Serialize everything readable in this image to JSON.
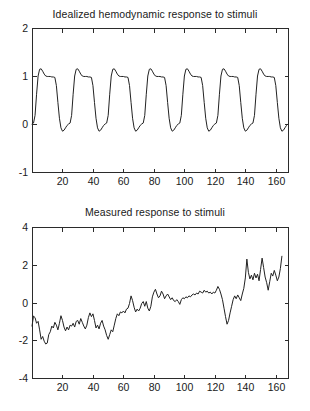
{
  "figure": {
    "background_color": "#ffffff",
    "line_color": "#222222",
    "axis_color": "#2b2b2b"
  },
  "charts": {
    "top": {
      "title": "Idealized hemodynamic response to stimuli",
      "ytick_labels": [
        "2",
        "1",
        "0",
        "-1"
      ],
      "xtick_labels": [
        "20",
        "40",
        "60",
        "80",
        "100",
        "120",
        "140",
        "160"
      ]
    },
    "bottom": {
      "title": "Measured response to stimuli",
      "ytick_labels": [
        "4",
        "2",
        "0",
        "-2",
        "-4"
      ],
      "xtick_labels": [
        "20",
        "40",
        "60",
        "80",
        "100",
        "120",
        "140",
        "160"
      ]
    }
  },
  "chart_data": [
    {
      "type": "line",
      "id": "idealized-hemodynamic-response",
      "title": "Idealized hemodynamic response to stimuli",
      "xlabel": "",
      "ylabel": "",
      "xlim": [
        0,
        168
      ],
      "ylim": [
        -1,
        2
      ],
      "xticks": [
        20,
        40,
        60,
        80,
        100,
        120,
        140,
        160
      ],
      "yticks": [
        -1,
        0,
        1,
        2
      ],
      "grid": false,
      "legend": null,
      "series": [
        {
          "name": "idealized response",
          "color": "#222222",
          "x": [
            0,
            1,
            2,
            3,
            4,
            5,
            6,
            7,
            8,
            9,
            10,
            11,
            12,
            13,
            14,
            15,
            16,
            17,
            18,
            19,
            20,
            21,
            22,
            23,
            24,
            25,
            26,
            27,
            28,
            29,
            30,
            31,
            32,
            33,
            34,
            35,
            36,
            37,
            38,
            39,
            40,
            41,
            42,
            43,
            44,
            45,
            46,
            47,
            48,
            49,
            50,
            51,
            52,
            53,
            54,
            55,
            56,
            57,
            58,
            59,
            60,
            61,
            62,
            63,
            64,
            65,
            66,
            67,
            68,
            69,
            70,
            71,
            72,
            73,
            74,
            75,
            76,
            77,
            78,
            79,
            80,
            81,
            82,
            83,
            84,
            85,
            86,
            87,
            88,
            89,
            90,
            91,
            92,
            93,
            94,
            95,
            96,
            97,
            98,
            99,
            100,
            101,
            102,
            103,
            104,
            105,
            106,
            107,
            108,
            109,
            110,
            111,
            112,
            113,
            114,
            115,
            116,
            117,
            118,
            119,
            120,
            121,
            122,
            123,
            124,
            125,
            126,
            127,
            128,
            129,
            130,
            131,
            132,
            133,
            134,
            135,
            136,
            137,
            138,
            139,
            140,
            141,
            142,
            143,
            144,
            145,
            146,
            147,
            148,
            149,
            150,
            151,
            152,
            153,
            154,
            155,
            156,
            157,
            158,
            159,
            160,
            161,
            162,
            163,
            164,
            165,
            166,
            167,
            168
          ],
          "y": [
            0.0,
            0.02,
            0.18,
            0.62,
            1.0,
            1.14,
            1.15,
            1.1,
            1.04,
            1.0,
            0.99,
            0.99,
            0.99,
            0.98,
            0.98,
            0.97,
            0.8,
            0.45,
            0.12,
            -0.08,
            -0.15,
            -0.13,
            -0.08,
            -0.03,
            0.0,
            0.02,
            0.18,
            0.62,
            1.0,
            1.14,
            1.15,
            1.1,
            1.04,
            1.0,
            0.99,
            0.99,
            0.99,
            0.98,
            0.98,
            0.97,
            0.8,
            0.45,
            0.12,
            -0.08,
            -0.15,
            -0.13,
            -0.08,
            -0.03,
            0.0,
            0.02,
            0.18,
            0.62,
            1.0,
            1.14,
            1.15,
            1.1,
            1.04,
            1.0,
            0.99,
            0.99,
            0.99,
            0.98,
            0.98,
            0.97,
            0.8,
            0.45,
            0.12,
            -0.08,
            -0.15,
            -0.13,
            -0.08,
            -0.03,
            0.0,
            0.02,
            0.18,
            0.62,
            1.0,
            1.14,
            1.15,
            1.1,
            1.04,
            1.0,
            0.99,
            0.99,
            0.99,
            0.98,
            0.98,
            0.97,
            0.8,
            0.45,
            0.12,
            -0.08,
            -0.15,
            -0.13,
            -0.08,
            -0.03,
            0.0,
            0.02,
            0.18,
            0.62,
            1.0,
            1.14,
            1.15,
            1.1,
            1.04,
            1.0,
            0.99,
            0.99,
            0.99,
            0.98,
            0.98,
            0.97,
            0.8,
            0.45,
            0.12,
            -0.08,
            -0.15,
            -0.13,
            -0.08,
            -0.03,
            0.0,
            0.02,
            0.18,
            0.62,
            1.0,
            1.14,
            1.15,
            1.1,
            1.04,
            1.0,
            0.99,
            0.99,
            0.99,
            0.98,
            0.98,
            0.97,
            0.8,
            0.45,
            0.12,
            -0.08,
            -0.15,
            -0.13,
            -0.08,
            -0.03,
            0.0,
            0.02,
            0.18,
            0.62,
            1.0,
            1.14,
            1.15,
            1.1,
            1.04,
            1.0,
            0.99,
            0.99,
            0.99,
            0.98,
            0.98,
            0.97,
            0.8,
            0.45,
            0.12,
            -0.08,
            -0.15,
            -0.13,
            -0.08,
            -0.03,
            0.0
          ]
        }
      ],
      "notes": "Seven periodic boxcar-convolved hemodynamic response cycles, period 24 time units, overshoot peak ~1.15, plateau ~1.0, post-stimulus undershoot ~-0.15, baseline 0."
    },
    {
      "type": "line",
      "id": "measured-response",
      "title": "Measured response to stimuli",
      "xlabel": "",
      "ylabel": "",
      "xlim": [
        0,
        168
      ],
      "ylim": [
        -4,
        4
      ],
      "xticks": [
        20,
        40,
        60,
        80,
        100,
        120,
        140,
        160
      ],
      "yticks": [
        -4,
        -2,
        0,
        2,
        4
      ],
      "grid": false,
      "legend": null,
      "series": [
        {
          "name": "measured response",
          "color": "#222222",
          "x": [
            0,
            1,
            2,
            3,
            4,
            5,
            6,
            7,
            8,
            9,
            10,
            11,
            12,
            13,
            14,
            15,
            16,
            17,
            18,
            19,
            20,
            21,
            22,
            23,
            24,
            25,
            26,
            27,
            28,
            29,
            30,
            31,
            32,
            33,
            34,
            35,
            36,
            37,
            38,
            39,
            40,
            41,
            42,
            43,
            44,
            45,
            46,
            47,
            48,
            49,
            50,
            51,
            52,
            53,
            54,
            55,
            56,
            57,
            58,
            59,
            60,
            61,
            62,
            63,
            64,
            65,
            66,
            67,
            68,
            69,
            70,
            71,
            72,
            73,
            74,
            75,
            76,
            77,
            78,
            79,
            80,
            81,
            82,
            83,
            84,
            85,
            86,
            87,
            88,
            89,
            90,
            91,
            92,
            93,
            94,
            95,
            96,
            97,
            98,
            99,
            100,
            101,
            102,
            103,
            104,
            105,
            106,
            107,
            108,
            109,
            110,
            111,
            112,
            113,
            114,
            115,
            116,
            117,
            118,
            119,
            120,
            121,
            122,
            123,
            124,
            125,
            126,
            127,
            128,
            129,
            130,
            131,
            132,
            133,
            134,
            135,
            136,
            137,
            138,
            139,
            140,
            141,
            142,
            143,
            144,
            145,
            146,
            147,
            148,
            149,
            150,
            151,
            152,
            153,
            154,
            155,
            156,
            157,
            158,
            159,
            160,
            161,
            162,
            163,
            164,
            165,
            166,
            167,
            168
          ],
          "y": [
            -1.25,
            -0.72,
            -0.8,
            -1.1,
            -1.0,
            -1.45,
            -1.95,
            -1.8,
            -2.05,
            -2.2,
            -2.15,
            -1.7,
            -1.55,
            -1.25,
            -1.35,
            -1.05,
            -1.2,
            -1.45,
            -1.1,
            -0.7,
            -0.95,
            -1.3,
            -1.5,
            -1.3,
            -1.45,
            -1.2,
            -1.25,
            -1.1,
            -1.3,
            -1.0,
            -0.95,
            -1.15,
            -0.85,
            -1.05,
            -1.25,
            -1.4,
            -1.2,
            -0.8,
            -0.55,
            -0.75,
            -0.6,
            -0.95,
            -1.35,
            -1.2,
            -1.4,
            -1.1,
            -0.95,
            -1.25,
            -1.45,
            -1.75,
            -1.95,
            -1.7,
            -1.45,
            -1.55,
            -1.2,
            -0.85,
            -0.6,
            -0.7,
            -0.5,
            -0.55,
            -0.45,
            -0.55,
            -0.35,
            -0.3,
            -0.05,
            0.35,
            0.1,
            -0.25,
            -0.5,
            -0.35,
            -0.45,
            -0.3,
            -0.05,
            0.05,
            -0.2,
            0.05,
            -0.3,
            -0.45,
            -0.2,
            0.3,
            0.55,
            0.7,
            0.45,
            0.25,
            0.35,
            0.6,
            0.45,
            0.2,
            0.35,
            0.45,
            0.3,
            0.15,
            0.25,
            0.1,
            0.05,
            0.15,
            0.05,
            -0.1,
            0.15,
            0.25,
            0.2,
            0.3,
            0.25,
            0.35,
            0.3,
            0.4,
            0.45,
            0.4,
            0.5,
            0.45,
            0.6,
            0.55,
            0.5,
            0.65,
            0.55,
            0.6,
            0.5,
            0.55,
            0.45,
            0.55,
            0.5,
            0.65,
            0.85,
            0.7,
            0.45,
            0.15,
            -0.3,
            -0.75,
            -1.15,
            -0.95,
            -0.55,
            -0.2,
            0.15,
            0.35,
            0.2,
            0.4,
            0.25,
            0.1,
            0.45,
            0.75,
            1.3,
            2.3,
            1.6,
            1.25,
            1.45,
            1.2,
            1.55,
            1.3,
            1.5,
            1.15,
            1.75,
            2.35,
            1.85,
            1.35,
            1.05,
            0.65,
            1.1,
            1.55,
            1.4,
            1.7,
            1.45,
            1.15,
            1.35,
            1.8,
            2.45
          ]
        }
      ],
      "notes": "Noisy fMRI-like measured signal with upward linear drift; starts near -1.2, trough ~-2.2 around t=10, notable dip to ~-1.2 near t=130, ends ~+2.45."
    }
  ]
}
